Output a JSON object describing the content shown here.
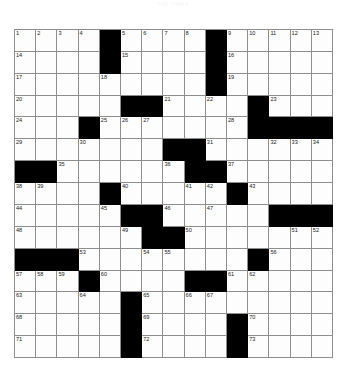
{
  "puzzle": {
    "title": "THE TIMES",
    "grid_size": 15,
    "colors": {
      "block": "#000000",
      "cell": "#fdfdfd",
      "gridline": "#8e8e8e",
      "number": "#1a1a1a",
      "title": "#f2f2f2"
    },
    "blocks": [
      [
        0,
        4
      ],
      [
        0,
        9
      ],
      [
        1,
        4
      ],
      [
        1,
        9
      ],
      [
        2,
        9
      ],
      [
        3,
        5
      ],
      [
        3,
        6
      ],
      [
        3,
        11
      ],
      [
        4,
        3
      ],
      [
        4,
        11
      ],
      [
        4,
        12
      ],
      [
        4,
        13
      ],
      [
        4,
        14
      ],
      [
        5,
        7
      ],
      [
        5,
        8
      ],
      [
        6,
        0
      ],
      [
        6,
        1
      ],
      [
        6,
        8
      ],
      [
        6,
        9
      ],
      [
        7,
        4
      ],
      [
        7,
        10
      ],
      [
        8,
        5
      ],
      [
        8,
        6
      ],
      [
        8,
        12
      ],
      [
        8,
        13
      ],
      [
        8,
        14
      ],
      [
        9,
        6
      ],
      [
        9,
        7
      ],
      [
        10,
        0
      ],
      [
        10,
        1
      ],
      [
        10,
        2
      ],
      [
        10,
        11
      ],
      [
        11,
        3
      ],
      [
        11,
        8
      ],
      [
        11,
        9
      ],
      [
        12,
        5
      ],
      [
        13,
        5
      ],
      [
        13,
        10
      ],
      [
        14,
        5
      ],
      [
        14,
        10
      ]
    ],
    "numbers": [
      {
        "row": 0,
        "col": 0,
        "n": "1"
      },
      {
        "row": 0,
        "col": 1,
        "n": "2"
      },
      {
        "row": 0,
        "col": 2,
        "n": "3"
      },
      {
        "row": 0,
        "col": 3,
        "n": "4"
      },
      {
        "row": 0,
        "col": 5,
        "n": "5"
      },
      {
        "row": 0,
        "col": 6,
        "n": "6"
      },
      {
        "row": 0,
        "col": 7,
        "n": "7"
      },
      {
        "row": 0,
        "col": 8,
        "n": "8"
      },
      {
        "row": 0,
        "col": 10,
        "n": "9"
      },
      {
        "row": 0,
        "col": 11,
        "n": "10"
      },
      {
        "row": 0,
        "col": 12,
        "n": "11"
      },
      {
        "row": 0,
        "col": 13,
        "n": "12"
      },
      {
        "row": 0,
        "col": 14,
        "n": "13"
      },
      {
        "row": 1,
        "col": 0,
        "n": "14"
      },
      {
        "row": 1,
        "col": 5,
        "n": "15"
      },
      {
        "row": 1,
        "col": 10,
        "n": "16"
      },
      {
        "row": 2,
        "col": 0,
        "n": "17"
      },
      {
        "row": 2,
        "col": 4,
        "n": "18"
      },
      {
        "row": 2,
        "col": 10,
        "n": "19"
      },
      {
        "row": 3,
        "col": 0,
        "n": "20"
      },
      {
        "row": 3,
        "col": 7,
        "n": "21"
      },
      {
        "row": 3,
        "col": 9,
        "n": "22"
      },
      {
        "row": 3,
        "col": 12,
        "n": "23"
      },
      {
        "row": 4,
        "col": 0,
        "n": "24"
      },
      {
        "row": 4,
        "col": 4,
        "n": "25"
      },
      {
        "row": 4,
        "col": 5,
        "n": "26"
      },
      {
        "row": 4,
        "col": 6,
        "n": "27"
      },
      {
        "row": 4,
        "col": 10,
        "n": "28"
      },
      {
        "row": 5,
        "col": 0,
        "n": "29"
      },
      {
        "row": 5,
        "col": 3,
        "n": "30"
      },
      {
        "row": 5,
        "col": 9,
        "n": "31"
      },
      {
        "row": 5,
        "col": 12,
        "n": "32"
      },
      {
        "row": 5,
        "col": 13,
        "n": "33"
      },
      {
        "row": 5,
        "col": 14,
        "n": "34"
      },
      {
        "row": 6,
        "col": 2,
        "n": "35"
      },
      {
        "row": 6,
        "col": 7,
        "n": "36"
      },
      {
        "row": 6,
        "col": 10,
        "n": "37"
      },
      {
        "row": 7,
        "col": 0,
        "n": "38"
      },
      {
        "row": 7,
        "col": 1,
        "n": "39"
      },
      {
        "row": 7,
        "col": 5,
        "n": "40"
      },
      {
        "row": 7,
        "col": 8,
        "n": "41"
      },
      {
        "row": 7,
        "col": 9,
        "n": "42"
      },
      {
        "row": 7,
        "col": 11,
        "n": "43"
      },
      {
        "row": 8,
        "col": 0,
        "n": "44"
      },
      {
        "row": 8,
        "col": 4,
        "n": "45"
      },
      {
        "row": 8,
        "col": 7,
        "n": "46"
      },
      {
        "row": 8,
        "col": 9,
        "n": "47"
      },
      {
        "row": 9,
        "col": 0,
        "n": "48"
      },
      {
        "row": 9,
        "col": 5,
        "n": "49"
      },
      {
        "row": 9,
        "col": 8,
        "n": "50"
      },
      {
        "row": 9,
        "col": 13,
        "n": "51"
      },
      {
        "row": 9,
        "col": 14,
        "n": "52"
      },
      {
        "row": 10,
        "col": 3,
        "n": "53"
      },
      {
        "row": 10,
        "col": 6,
        "n": "54"
      },
      {
        "row": 10,
        "col": 7,
        "n": "55"
      },
      {
        "row": 10,
        "col": 12,
        "n": "56"
      },
      {
        "row": 11,
        "col": 0,
        "n": "57"
      },
      {
        "row": 11,
        "col": 1,
        "n": "58"
      },
      {
        "row": 11,
        "col": 2,
        "n": "59"
      },
      {
        "row": 11,
        "col": 4,
        "n": "60"
      },
      {
        "row": 11,
        "col": 10,
        "n": "61"
      },
      {
        "row": 11,
        "col": 11,
        "n": "62"
      },
      {
        "row": 12,
        "col": 0,
        "n": "63"
      },
      {
        "row": 12,
        "col": 3,
        "n": "64"
      },
      {
        "row": 12,
        "col": 6,
        "n": "65"
      },
      {
        "row": 12,
        "col": 8,
        "n": "66"
      },
      {
        "row": 12,
        "col": 9,
        "n": "67"
      },
      {
        "row": 13,
        "col": 0,
        "n": "68"
      },
      {
        "row": 13,
        "col": 6,
        "n": "69"
      },
      {
        "row": 13,
        "col": 11,
        "n": "70"
      },
      {
        "row": 14,
        "col": 0,
        "n": "71"
      },
      {
        "row": 14,
        "col": 6,
        "n": "72"
      },
      {
        "row": 14,
        "col": 11,
        "n": "73"
      }
    ]
  }
}
